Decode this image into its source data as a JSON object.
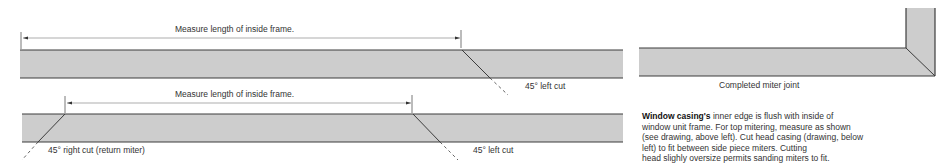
{
  "colors": {
    "board_fill": "#cdcdcd",
    "board_edge": "#3c3c3c",
    "text": "#333333"
  },
  "top_left_drawing": {
    "measure_label": "Measure length of inside frame.",
    "cut_label": "45° left cut"
  },
  "top_right_drawing": {
    "caption": "Completed miter joint"
  },
  "bottom_left_drawing": {
    "measure_label": "Measure length of inside frame.",
    "right_cut_label": "45° right cut (return miter)",
    "left_cut_label": "45° left cut"
  },
  "description": {
    "title": "Window casing's",
    "line1_rest": " inner edge is flush with inside of",
    "line2": "window unit frame. For top mitering, measure as shown",
    "line3": "(see drawing, above left). Cut head casing (drawing, below",
    "line4": "left) to fit between side piece miters. Cutting",
    "line5": "head slighly oversize permits sanding miters to fit."
  }
}
